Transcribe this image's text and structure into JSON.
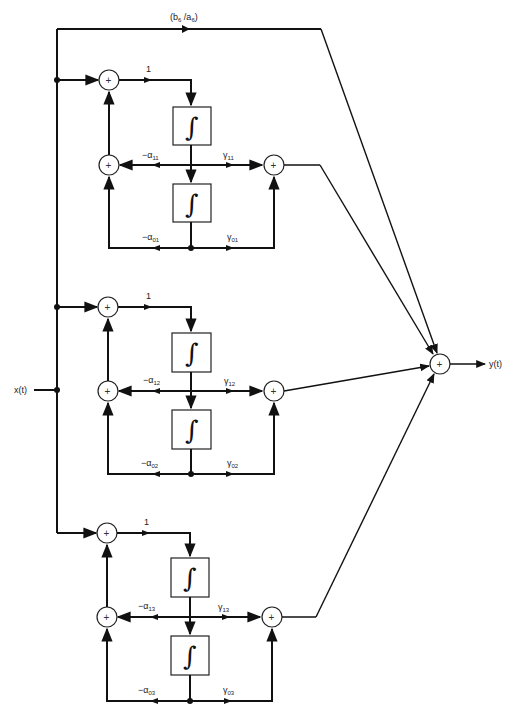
{
  "diagram": {
    "type": "parallel-form state-variable block diagram",
    "input_label": "x(t)",
    "output_label": "y(t)",
    "feedthrough_gain": "(b6 / a6)",
    "feedthrough_gain_parts": {
      "b": "b",
      "b_sub": "6",
      "sep": " /",
      "a": "a",
      "a_sub": "6"
    },
    "sum_symbol": "+",
    "integrator_symbol": "∫",
    "stages": [
      {
        "id": "stage-1",
        "forward_gain": "1",
        "alpha1": {
          "prefix": "−α",
          "sub": "11"
        },
        "gamma1": {
          "prefix": "γ",
          "sub": "11"
        },
        "alpha0": {
          "prefix": "−α",
          "sub": "01"
        },
        "gamma0": {
          "prefix": "γ",
          "sub": "01"
        }
      },
      {
        "id": "stage-2",
        "forward_gain": "1",
        "alpha1": {
          "prefix": "−α",
          "sub": "12"
        },
        "gamma1": {
          "prefix": "γ",
          "sub": "12"
        },
        "alpha0": {
          "prefix": "−α",
          "sub": "02"
        },
        "gamma0": {
          "prefix": "γ",
          "sub": "02"
        }
      },
      {
        "id": "stage-3",
        "forward_gain": "1",
        "alpha1": {
          "prefix": "−α",
          "sub": "13"
        },
        "gamma1": {
          "prefix": "γ",
          "sub": "13"
        },
        "alpha0": {
          "prefix": "−α",
          "sub": "03"
        },
        "gamma0": {
          "prefix": "γ",
          "sub": "03"
        }
      }
    ]
  },
  "colors": {
    "line": "#111111",
    "background": "#ffffff"
  }
}
